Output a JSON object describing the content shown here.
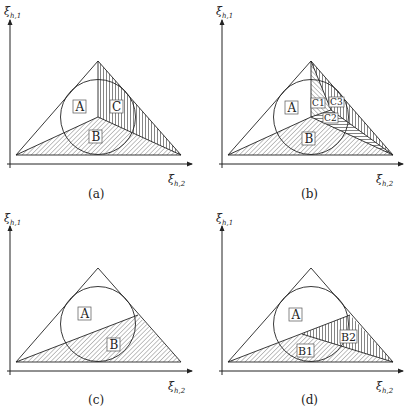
{
  "figure": {
    "panels": [
      {
        "id": "a",
        "caption": "(a)",
        "y_axis_label": "ξ",
        "y_axis_sub": "h,1",
        "x_axis_label": "ξ",
        "x_axis_sub": "h,2",
        "regions": [
          {
            "label": "A",
            "hatch": "none"
          },
          {
            "label": "B",
            "hatch": "diagonal"
          },
          {
            "label": "C",
            "hatch": "vertical"
          }
        ]
      },
      {
        "id": "b",
        "caption": "(b)",
        "y_axis_label": "ξ",
        "y_axis_sub": "h,1",
        "x_axis_label": "ξ",
        "x_axis_sub": "h,2",
        "regions": [
          {
            "label": "A",
            "hatch": "none"
          },
          {
            "label": "B",
            "hatch": "diagonal"
          },
          {
            "label": "C1",
            "hatch": "diagonal"
          },
          {
            "label": "C2",
            "hatch": "horizontal"
          },
          {
            "label": "C3",
            "hatch": "vertical"
          }
        ]
      },
      {
        "id": "c",
        "caption": "(c)",
        "y_axis_label": "ξ",
        "y_axis_sub": "h,1",
        "x_axis_label": "ξ",
        "x_axis_sub": "h,2",
        "regions": [
          {
            "label": "A",
            "hatch": "none"
          },
          {
            "label": "B",
            "hatch": "diagonal"
          }
        ]
      },
      {
        "id": "d",
        "caption": "(d)",
        "y_axis_label": "ξ",
        "y_axis_sub": "h,1",
        "x_axis_label": "ξ",
        "x_axis_sub": "h,2",
        "regions": [
          {
            "label": "A",
            "hatch": "none"
          },
          {
            "label": "B1",
            "hatch": "diagonal"
          },
          {
            "label": "B2",
            "hatch": "vertical"
          }
        ]
      }
    ],
    "colors": {
      "ink": "#222222",
      "background": "#ffffff"
    }
  }
}
